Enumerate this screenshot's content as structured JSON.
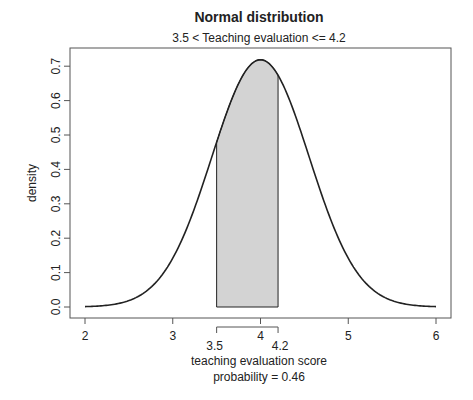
{
  "chart_data": {
    "type": "area",
    "title": "Normal distribution",
    "subtitle": "3.5 < Teaching evaluation <= 4.2",
    "xlabel": "teaching evaluation score",
    "ylabel": "density",
    "annotation": "probability = 0.46",
    "distribution": {
      "mean": 4.0,
      "sd": 0.555
    },
    "xlim": [
      2,
      6
    ],
    "ylim": [
      0,
      0.72
    ],
    "x_ticks": [
      2,
      3,
      4,
      5,
      6
    ],
    "y_ticks": [
      "0.0",
      "0.1",
      "0.2",
      "0.3",
      "0.4",
      "0.5",
      "0.6",
      "0.7"
    ],
    "y_tick_values": [
      0,
      0.1,
      0.2,
      0.3,
      0.4,
      0.5,
      0.6,
      0.7
    ],
    "shaded_region": {
      "lower": 3.5,
      "upper": 4.2,
      "lower_label": "3.5",
      "upper_label": "4.2",
      "probability": 0.46
    },
    "grid": false,
    "legend": null,
    "colors": {
      "curve": "#222222",
      "shade": "#d3d3d3",
      "axis": "#555555"
    }
  }
}
